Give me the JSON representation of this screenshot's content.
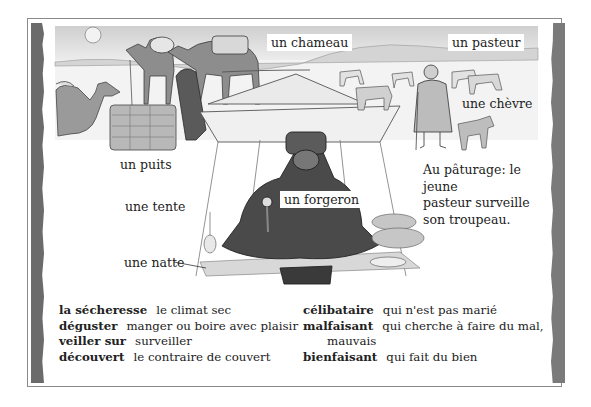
{
  "labels": {
    "chameau": "un chameau",
    "pasteur": "un pasteur",
    "chevre": "une chèvre",
    "puits": "un puits",
    "tente": "une tente",
    "forgeron": "un forgeron",
    "natte": "une natte"
  },
  "caption": {
    "line1": "Au pâturage: le jeune",
    "line2": "pasteur surveille",
    "line3": "son troupeau."
  },
  "glossary": {
    "left": [
      {
        "term": "la sécheresse",
        "definition": "le climat sec"
      },
      {
        "term": "déguster",
        "definition": "manger ou boire avec plaisir"
      },
      {
        "term": "veiller sur",
        "definition": "surveiller"
      },
      {
        "term": "découvert",
        "definition": "le contraire de couvert"
      }
    ],
    "right": [
      {
        "term": "célibataire",
        "definition": "qui n'est pas marié"
      },
      {
        "term": "malfaisant",
        "definition": "qui cherche à faire du mal,",
        "continuation": "mauvais"
      },
      {
        "term": "bienfaisant",
        "definition": "qui fait du bien"
      }
    ]
  },
  "colors": {
    "frame_border": "#8a8a8a",
    "side_bar_left": "#6b6b6b",
    "side_bar_right": "#7a7a7a",
    "sky": "#d9d9d9",
    "text": "#222222"
  }
}
